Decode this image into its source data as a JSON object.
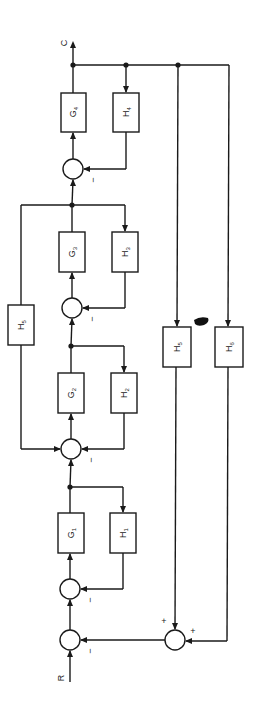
{
  "diagram": {
    "type": "block-diagram",
    "orientation": "rotated-90-ccw",
    "input_label": "R",
    "output_label": "C",
    "forward_blocks": [
      {
        "id": "G1",
        "letter": "G",
        "sub": "1"
      },
      {
        "id": "G2",
        "letter": "G",
        "sub": "2"
      },
      {
        "id": "G3",
        "letter": "G",
        "sub": "3"
      },
      {
        "id": "G4",
        "letter": "G",
        "sub": "4"
      }
    ],
    "feedback_blocks": [
      {
        "id": "H1",
        "letter": "H",
        "sub": "1"
      },
      {
        "id": "H2",
        "letter": "H",
        "sub": "2"
      },
      {
        "id": "H3",
        "letter": "H",
        "sub": "3"
      },
      {
        "id": "H4",
        "letter": "H",
        "sub": "4"
      },
      {
        "id": "H5_inner",
        "letter": "H",
        "sub": "5"
      },
      {
        "id": "H5_outer",
        "letter": "H",
        "sub": "5"
      },
      {
        "id": "H6",
        "letter": "H",
        "sub": "6"
      }
    ],
    "signs": {
      "sum0_feedback": "−",
      "sum1_feedback": "−",
      "sum2_feedback": "−",
      "sum3_feedback": "−",
      "sum4_feedback": "−",
      "outer_sum_in1": "+",
      "outer_sum_in2": "+"
    },
    "colors": {
      "ink": "#1a1a1a",
      "background": "#ffffff"
    }
  }
}
